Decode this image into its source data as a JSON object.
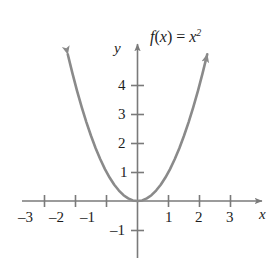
{
  "figure": {
    "kind": "coordinate-plane-graph",
    "background_color": "#ffffff",
    "curve_color": "#8a8a8a",
    "axis_color": "#7a7a7a",
    "text_color": "#1c1c1c"
  },
  "function_label": {
    "full": "f(x) = x²",
    "f": "f",
    "open_paren": "(",
    "arg": "x",
    "close_paren": ")",
    "equals": "=",
    "base": "x",
    "exponent": "2"
  },
  "axes": {
    "x_name": "x",
    "y_name": "y",
    "x_ticks": [
      {
        "value": -3,
        "label": "–3"
      },
      {
        "value": -2,
        "label": "–2"
      },
      {
        "value": -1,
        "label": "–1"
      },
      {
        "value": 1,
        "label": "1"
      },
      {
        "value": 2,
        "label": "2"
      },
      {
        "value": 3,
        "label": "3"
      }
    ],
    "y_ticks": [
      {
        "value": 4,
        "label": "4"
      },
      {
        "value": 3,
        "label": "3"
      },
      {
        "value": 2,
        "label": "2"
      },
      {
        "value": 1,
        "label": "1"
      },
      {
        "value": -1,
        "label": "–1"
      }
    ]
  },
  "chart_data": {
    "type": "line",
    "xlabel": "x",
    "ylabel": "y",
    "xlim": [
      -3.6,
      3.6
    ],
    "ylim": [
      -1.9,
      5.1
    ],
    "grid": false,
    "legend": "none",
    "annotations": [
      "f(x) = x²"
    ],
    "xticks": [
      -3,
      -2,
      -1,
      1,
      2,
      3
    ],
    "yticks": [
      -1,
      1,
      2,
      3,
      4
    ],
    "series": [
      {
        "name": "f(x) = x²",
        "color": "#8a8a8a",
        "arrow_start": true,
        "arrow_end": true,
        "x": [
          -2.25,
          -2.1,
          -1.95,
          -1.8,
          -1.65,
          -1.5,
          -1.35,
          -1.2,
          -1.05,
          -0.9,
          -0.75,
          -0.6,
          -0.45,
          -0.3,
          -0.15,
          0,
          0.15,
          0.3,
          0.45,
          0.6,
          0.75,
          0.9,
          1.05,
          1.2,
          1.35,
          1.5,
          1.65,
          1.8,
          1.95,
          2.1,
          2.25
        ],
        "y": [
          5.06,
          4.41,
          3.8,
          3.24,
          2.72,
          2.25,
          1.82,
          1.44,
          1.1,
          0.81,
          0.56,
          0.36,
          0.2,
          0.09,
          0.02,
          0,
          0.02,
          0.09,
          0.2,
          0.36,
          0.56,
          0.81,
          1.1,
          1.44,
          1.82,
          2.25,
          2.72,
          3.24,
          3.8,
          4.41,
          5.06
        ]
      }
    ]
  }
}
